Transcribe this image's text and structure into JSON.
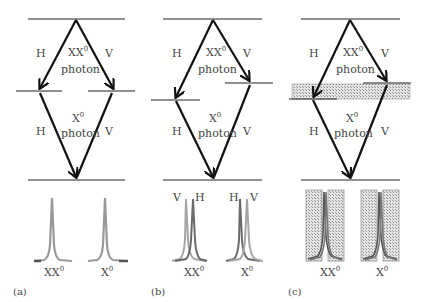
{
  "figure": {
    "panels": [
      {
        "id": "a",
        "label": "(a)",
        "top_left_pol": "H",
        "top_right_pol": "V",
        "top_photon": "XX",
        "top_photon_sup": "0",
        "top_photon_word": "photon",
        "bottom_left_pol": "H",
        "bottom_right_pol": "V",
        "bottom_photon": "X",
        "bottom_photon_sup": "0",
        "bottom_photon_word": "photon",
        "spectrum_left": "XX",
        "spectrum_left_sup": "0",
        "spectrum_right": "X",
        "spectrum_right_sup": "0"
      },
      {
        "id": "b",
        "label": "(b)",
        "top_left_pol": "H",
        "top_right_pol": "V",
        "top_photon": "XX",
        "top_photon_sup": "0",
        "top_photon_word": "photon",
        "bottom_left_pol": "H",
        "bottom_right_pol": "V",
        "bottom_photon": "X",
        "bottom_photon_sup": "0",
        "bottom_photon_word": "photon",
        "spectrum_left": "XX",
        "spectrum_left_sup": "0",
        "spectrum_right": "X",
        "spectrum_right_sup": "0",
        "peak_labels_left": [
          "V",
          "H"
        ],
        "peak_labels_right": [
          "H",
          "V"
        ]
      },
      {
        "id": "c",
        "label": "(c)",
        "top_left_pol": "H",
        "top_right_pol": "V",
        "top_photon": "XX",
        "top_photon_sup": "0",
        "top_photon_word": "photon",
        "bottom_left_pol": "H",
        "bottom_right_pol": "V",
        "bottom_photon": "X",
        "bottom_photon_sup": "0",
        "bottom_photon_word": "photon",
        "spectrum_left": "XX",
        "spectrum_left_sup": "0",
        "spectrum_right": "X",
        "spectrum_right_sup": "0"
      }
    ]
  },
  "colors": {
    "line": "#222222",
    "arrow": "#111111",
    "text": "#444444",
    "peak_light": "#9a9a9a",
    "peak_dark": "#666666",
    "hatch_fill": "#d0d0d0"
  }
}
